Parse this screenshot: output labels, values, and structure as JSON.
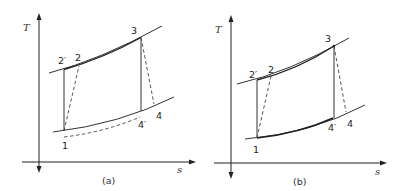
{
  "figure": {
    "panels": [
      {
        "id": "a",
        "caption": "(a)",
        "axes": {
          "y_label": "T",
          "x_label": "s"
        },
        "points": {
          "p2prime": "2′",
          "p2": "2",
          "p3": "3",
          "p4": "4",
          "p4prime": "4′",
          "p1": "1"
        },
        "notes": "Lower dashed curve below the low-pressure isobar from 1 to 4′"
      },
      {
        "id": "b",
        "caption": "(b)",
        "axes": {
          "y_label": "T",
          "x_label": "s"
        },
        "points": {
          "p2prime": "2′",
          "p2": "2",
          "p3": "3",
          "p4": "4",
          "p4prime": "4′",
          "p1": "1"
        }
      }
    ]
  }
}
